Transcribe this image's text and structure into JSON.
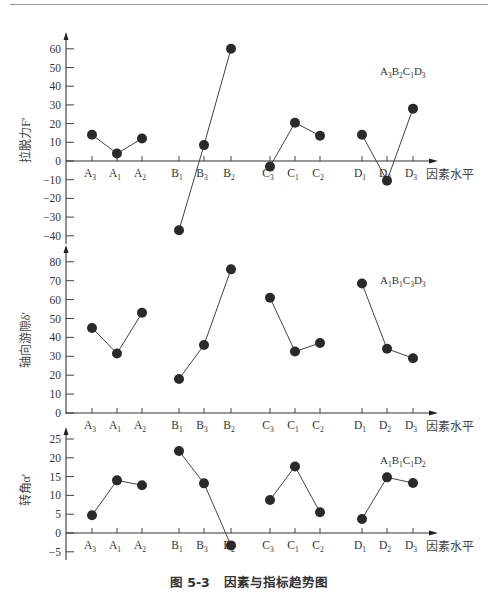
{
  "caption": {
    "figure_no": "图 5-3",
    "title": "因素与指标趋势图"
  },
  "x_axis_label": "因素水平",
  "chart_data": [
    {
      "type": "line",
      "title": "",
      "ylabel": "拉脱力F′",
      "xlabel": "因素水平",
      "yticks": [
        60,
        50,
        40,
        30,
        20,
        10,
        0,
        -10,
        -20,
        -30,
        -40
      ],
      "ylim": [
        -40,
        60
      ],
      "grid": false,
      "categories": [
        "A3",
        "A1",
        "A2",
        "B1",
        "B3",
        "B2",
        "C3",
        "C1",
        "C2",
        "D1",
        "D2",
        "D3"
      ],
      "series": [
        {
          "name": "A",
          "x": [
            "A3",
            "A1",
            "A2"
          ],
          "values": [
            14,
            4,
            12
          ]
        },
        {
          "name": "B",
          "x": [
            "B1",
            "B3",
            "B2"
          ],
          "values": [
            -37,
            8.5,
            60
          ]
        },
        {
          "name": "C",
          "x": [
            "C3",
            "C1",
            "C2"
          ],
          "values": [
            -3,
            20.5,
            13.5
          ]
        },
        {
          "name": "D",
          "x": [
            "D1",
            "D2",
            "D3"
          ],
          "values": [
            14,
            -10.5,
            28
          ]
        }
      ],
      "annotation": {
        "base": [
          "A",
          "B",
          "C",
          "D"
        ],
        "subs": [
          "3",
          "2",
          "1",
          "3"
        ]
      }
    },
    {
      "type": "line",
      "title": "",
      "ylabel": "轴向游隙δ′",
      "xlabel": "因素水平",
      "yticks": [
        80,
        70,
        60,
        50,
        40,
        30,
        20,
        10,
        0
      ],
      "ylim": [
        0,
        80
      ],
      "grid": false,
      "categories": [
        "A3",
        "A1",
        "A2",
        "B1",
        "B3",
        "B2",
        "C3",
        "C1",
        "C2",
        "D1",
        "D2",
        "D3"
      ],
      "series": [
        {
          "name": "A",
          "x": [
            "A3",
            "A1",
            "A2"
          ],
          "values": [
            45,
            31.5,
            53
          ]
        },
        {
          "name": "B",
          "x": [
            "B1",
            "B3",
            "B2"
          ],
          "values": [
            18,
            36,
            76
          ]
        },
        {
          "name": "C",
          "x": [
            "C3",
            "C1",
            "C2"
          ],
          "values": [
            61,
            32.5,
            37
          ]
        },
        {
          "name": "D",
          "x": [
            "D1",
            "D2",
            "D3"
          ],
          "values": [
            68.5,
            34,
            29
          ]
        }
      ],
      "annotation": {
        "base": [
          "A",
          "B",
          "C",
          "D"
        ],
        "subs": [
          "1",
          "1",
          "3",
          "3"
        ]
      }
    },
    {
      "type": "line",
      "title": "",
      "ylabel": "转角α′",
      "xlabel": "因素水平",
      "yticks": [
        25,
        20,
        15,
        10,
        5,
        0,
        -5
      ],
      "ylim": [
        -5,
        25
      ],
      "grid": false,
      "categories": [
        "A3",
        "A1",
        "A2",
        "B1",
        "B3",
        "B2",
        "C3",
        "C1",
        "C2",
        "D1",
        "D2",
        "D3"
      ],
      "series": [
        {
          "name": "A",
          "x": [
            "A3",
            "A1",
            "A2"
          ],
          "values": [
            4.7,
            14,
            12.7
          ]
        },
        {
          "name": "B",
          "x": [
            "B1",
            "B3",
            "B2"
          ],
          "values": [
            21.8,
            13.2,
            -3.3
          ]
        },
        {
          "name": "C",
          "x": [
            "C3",
            "C1",
            "C2"
          ],
          "values": [
            8.8,
            17.7,
            5.5
          ]
        },
        {
          "name": "D",
          "x": [
            "D1",
            "D2",
            "D3"
          ],
          "values": [
            3.7,
            14.8,
            13.3
          ]
        }
      ],
      "annotation": {
        "base": [
          "A",
          "B",
          "C",
          "D"
        ],
        "subs": [
          "1",
          "1",
          "1",
          "2"
        ]
      }
    }
  ]
}
